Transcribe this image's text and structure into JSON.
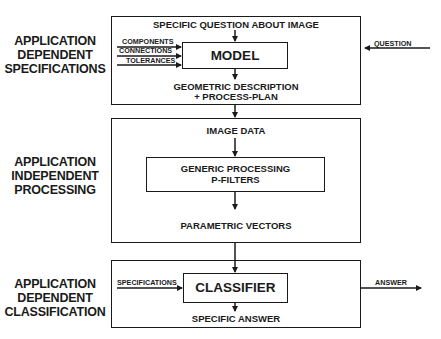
{
  "stages": [
    {
      "label_lines": [
        "APPLICATION",
        "DEPENDENT",
        "SPECIFICATIONS"
      ]
    },
    {
      "label_lines": [
        "APPLICATION",
        "INDEPENDENT",
        "PROCESSING"
      ]
    },
    {
      "label_lines": [
        "APPLICATION",
        "DEPENDENT",
        "CLASSIFICATION"
      ]
    }
  ],
  "specification_stage": {
    "top_text": "SPECIFIC QUESTION ABOUT IMAGE",
    "model_label": "MODEL",
    "inputs": [
      "COMPONENTS",
      "CONNECTIONS",
      "TOLERANCES"
    ],
    "output_line1": "GEOMETRIC DESCRIPTION",
    "output_line2": "+ PROCESS-PLAN",
    "external_input": "QUESTION"
  },
  "processing_stage": {
    "top_text": "IMAGE DATA",
    "filter_line1": "GENERIC PROCESSING",
    "filter_line2": "P-FILTERS",
    "output_text": "PARAMETRIC VECTORS"
  },
  "classification_stage": {
    "input": "SPECIFICATIONS",
    "classifier_label": "CLASSIFIER",
    "output_text": "SPECIFIC ANSWER",
    "external_output": "ANSWER"
  }
}
